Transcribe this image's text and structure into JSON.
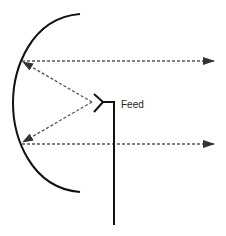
{
  "diagram": {
    "type": "parabolic-reflector-antenna",
    "labels": {
      "feed": "Feed"
    },
    "components": {
      "reflector": {
        "name": "reflector-dish",
        "shape": "parabolic-arc",
        "stroke": "#111111"
      },
      "feed_horn": {
        "name": "feed-horn",
        "stroke": "#111111"
      },
      "feed_line": {
        "name": "feed-line",
        "stroke": "#111111"
      },
      "incident_rays": [
        {
          "name": "ray-feed-to-top",
          "style": "dashed",
          "from": "feed",
          "to": "reflector-top"
        },
        {
          "name": "ray-feed-to-bottom",
          "style": "dashed",
          "from": "feed",
          "to": "reflector-bottom"
        }
      ],
      "reflected_rays": [
        {
          "name": "collimated-ray-top",
          "style": "dashed",
          "direction": "right"
        },
        {
          "name": "collimated-ray-bottom",
          "style": "dashed",
          "direction": "right"
        }
      ]
    },
    "colors": {
      "line": "#111111",
      "dashed": "#555555",
      "arrowhead": "#333333",
      "background": "#ffffff"
    }
  }
}
